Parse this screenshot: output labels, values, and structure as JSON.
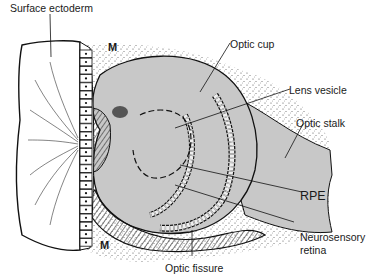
{
  "figure": {
    "labels": {
      "surface_ectoderm": "Surface ectoderm",
      "mesenchyme_top": "M",
      "mesenchyme_bottom": "M",
      "optic_cup": "Optic cup",
      "lens_vesicle": "Lens vesicle",
      "optic_stalk": "Optic stalk",
      "rpe": "RPE",
      "neurosensory_retina_line1": "Neurosensory",
      "neurosensory_retina_line2": "retina",
      "optic_fissure": "Optic fissure"
    },
    "colors": {
      "tissue_fill": "#c8c8c8",
      "outline": "#111111",
      "ectoderm_fill": "#ffffff",
      "stipple": "#333333"
    }
  }
}
